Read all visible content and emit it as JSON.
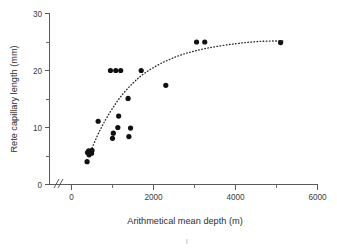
{
  "chart_data": {
    "type": "scatter",
    "title": "",
    "xlabel": "Arithmetical mean depth (m)",
    "ylabel": "Rete capillary length (mm)",
    "xlim": [
      0,
      6000
    ],
    "ylim": [
      0,
      30
    ],
    "grid": false,
    "legend": false,
    "axis_break": "//",
    "xticks_major": [
      0,
      2000,
      4000,
      6000
    ],
    "xticks_minor": [
      1000,
      3000,
      5000
    ],
    "xtick_labels": [
      "0",
      "2000",
      "4000",
      "6000"
    ],
    "yticks_major": [
      0,
      10,
      20,
      30
    ],
    "yticks_minor": [
      5,
      15,
      25
    ],
    "ytick_labels": [
      "0",
      "10",
      "20",
      "30"
    ],
    "series": [
      {
        "name": "Rete capillary length vs depth",
        "marker": "filled-circle",
        "color": "#111111",
        "points": [
          {
            "x": 380,
            "y": 4.0
          },
          {
            "x": 390,
            "y": 5.6
          },
          {
            "x": 420,
            "y": 5.9
          },
          {
            "x": 430,
            "y": 5.2
          },
          {
            "x": 460,
            "y": 5.6
          },
          {
            "x": 490,
            "y": 5.5
          },
          {
            "x": 500,
            "y": 6.0
          },
          {
            "x": 650,
            "y": 11.1
          },
          {
            "x": 950,
            "y": 20.0
          },
          {
            "x": 1000,
            "y": 8.1
          },
          {
            "x": 1020,
            "y": 9.0
          },
          {
            "x": 1080,
            "y": 20.0
          },
          {
            "x": 1130,
            "y": 10.0
          },
          {
            "x": 1150,
            "y": 12.0
          },
          {
            "x": 1200,
            "y": 20.0
          },
          {
            "x": 1380,
            "y": 15.1
          },
          {
            "x": 1400,
            "y": 8.4
          },
          {
            "x": 1440,
            "y": 9.9
          },
          {
            "x": 1700,
            "y": 20.0
          },
          {
            "x": 2300,
            "y": 17.4
          },
          {
            "x": 3050,
            "y": 25.0
          },
          {
            "x": 3250,
            "y": 25.0
          },
          {
            "x": 5100,
            "y": 24.9
          }
        ]
      }
    ],
    "trend_line": {
      "name": "fitted curve",
      "style": "dotted",
      "color": "#2a2a2a",
      "points": [
        {
          "x": 470,
          "y": 5.9
        },
        {
          "x": 700,
          "y": 9.6
        },
        {
          "x": 950,
          "y": 12.8
        },
        {
          "x": 1200,
          "y": 15.4
        },
        {
          "x": 1500,
          "y": 17.8
        },
        {
          "x": 1800,
          "y": 19.6
        },
        {
          "x": 2200,
          "y": 21.3
        },
        {
          "x": 2700,
          "y": 22.8
        },
        {
          "x": 3300,
          "y": 23.9
        },
        {
          "x": 4000,
          "y": 24.7
        },
        {
          "x": 4600,
          "y": 25.1
        },
        {
          "x": 5200,
          "y": 25.2
        }
      ]
    }
  },
  "figure": {
    "xlabel": "Arithmetical mean depth (m)",
    "ylabel": "Rete capillary length (mm)",
    "y_labels": {
      "t0": "0",
      "t10": "10",
      "t20": "20",
      "t30": "30"
    },
    "x_labels": {
      "t0": "0",
      "t2000": "2000",
      "t4000": "4000",
      "t6000": "6000"
    }
  }
}
